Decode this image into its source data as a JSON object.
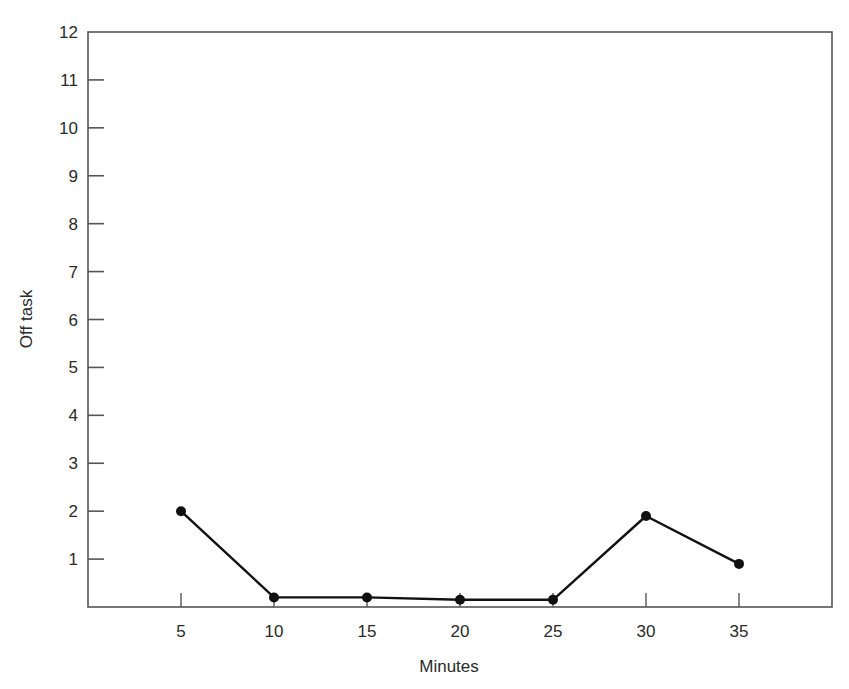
{
  "chart_data": {
    "type": "line",
    "title": "",
    "xlabel": "Minutes",
    "ylabel": "Off task",
    "x": [
      5,
      10,
      15,
      20,
      25,
      30,
      35
    ],
    "series": [
      {
        "name": "Off task",
        "values": [
          2.0,
          0.2,
          0.2,
          0.15,
          0.15,
          1.9,
          0.9
        ],
        "color": "#111111",
        "marker": "circle"
      }
    ],
    "xlim": [
      0,
      40
    ],
    "ylim": [
      0,
      12
    ],
    "x_ticks": [
      5,
      10,
      15,
      20,
      25,
      30,
      35
    ],
    "y_ticks": [
      1,
      2,
      3,
      4,
      5,
      6,
      7,
      8,
      9,
      10,
      11,
      12
    ],
    "grid": false,
    "legend": null
  },
  "colors": {
    "axis": "#555555",
    "line": "#111111",
    "text": "#2a2a2a"
  }
}
